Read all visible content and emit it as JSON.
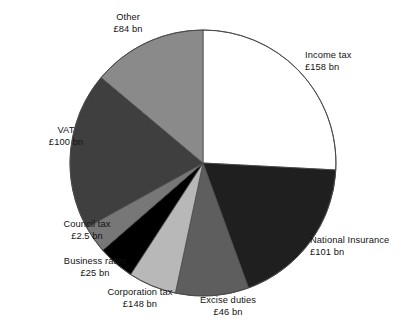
{
  "chart_data": {
    "type": "pie",
    "title": "",
    "subtitle": "",
    "xlabel": "",
    "ylabel": "",
    "legend_position": "none",
    "grid": false,
    "units": "£ bn",
    "center": {
      "x": 203,
      "y": 163
    },
    "radius": 133,
    "start_angle_deg": 0,
    "direction": "clockwise",
    "categories": [
      "Income tax",
      "National Insurance",
      "Excise duties",
      "Corporation tax",
      "Business rates",
      "Council tax",
      "VAT",
      "Other"
    ],
    "values": [
      158,
      101,
      46,
      148,
      25,
      2.5,
      100,
      84
    ],
    "value_labels": [
      "£158 bn",
      "£101 bn",
      "£46 bn",
      "£148 bn",
      "£25 bn",
      "£2.5 bn",
      "£100 bn",
      "£84 bn"
    ],
    "colors": [
      "#ffffff",
      "#1f1f1f",
      "#5e5e5e",
      "#b8b8b8",
      "#000000",
      "#777777",
      "#3f3f3f",
      "#8a8a8a"
    ],
    "slices": [
      {
        "key": "income_tax",
        "label": "Income tax",
        "value": 158,
        "value_label": "£158 bn",
        "color": "#ffffff",
        "start_deg": 0,
        "end_deg": 93
      },
      {
        "key": "national_insurance",
        "label": "National Insurance",
        "value": 101,
        "value_label": "£101 bn",
        "color": "#1f1f1f",
        "start_deg": 93,
        "end_deg": 160
      },
      {
        "key": "excise_duties",
        "label": "Excise duties",
        "value": 46,
        "value_label": "£46 bn",
        "color": "#5e5e5e",
        "start_deg": 160,
        "end_deg": 192
      },
      {
        "key": "corporation_tax",
        "label": "Corporation tax",
        "value": 148,
        "value_label": "£148 bn",
        "color": "#b8b8b8",
        "start_deg": 192,
        "end_deg": 213
      },
      {
        "key": "business_rates",
        "label": "Business rates",
        "value": 25,
        "value_label": "£25 bn",
        "color": "#000000",
        "start_deg": 213,
        "end_deg": 229
      },
      {
        "key": "council_tax",
        "label": "Council tax",
        "value": 2.5,
        "value_label": "£2.5 bn",
        "color": "#777777",
        "start_deg": 229,
        "end_deg": 241
      },
      {
        "key": "vat",
        "label": "VAT",
        "value": 100,
        "value_label": "£100 bn",
        "color": "#3f3f3f",
        "start_deg": 241,
        "end_deg": 310
      },
      {
        "key": "other",
        "label": "Other",
        "value": 84,
        "value_label": "£84 bn",
        "color": "#8a8a8a",
        "start_deg": 310,
        "end_deg": 360
      }
    ],
    "outline_color": "#4a4a4a",
    "background": "#ffffff"
  }
}
